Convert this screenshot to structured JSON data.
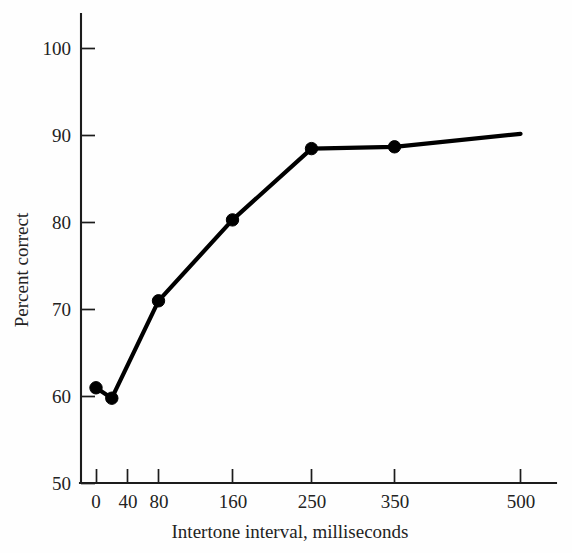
{
  "chart_data": {
    "type": "line",
    "title": "",
    "xlabel": "Intertone interval, milliseconds",
    "ylabel": "Percent correct",
    "x_tick_labels": [
      "0",
      "40",
      "80",
      "160",
      "250",
      "350",
      "500"
    ],
    "x_tick_values": [
      0,
      40,
      80,
      160,
      250,
      350,
      500
    ],
    "y_tick_labels": [
      "50",
      "60",
      "70",
      "80",
      "90",
      "100"
    ],
    "y_tick_values": [
      50,
      60,
      70,
      80,
      90,
      100
    ],
    "ylim": [
      50,
      100
    ],
    "grid": false,
    "legend": null,
    "x_axis_scale": "categorical-nonlinear",
    "series": [
      {
        "name": "Percent correct",
        "marker": "filled-circle",
        "color": "#000000",
        "points": [
          {
            "x": 0,
            "y": 61.0
          },
          {
            "x": 20,
            "y": 59.8
          },
          {
            "x": 80,
            "y": 71.0
          },
          {
            "x": 160,
            "y": 80.3
          },
          {
            "x": 250,
            "y": 88.5
          },
          {
            "x": 350,
            "y": 88.7
          },
          {
            "x": 500,
            "y": 90.2
          }
        ]
      }
    ]
  },
  "figure": {
    "background_color": "#fefefe",
    "axis_color": "#1c1c1c",
    "text_color": "#232323"
  }
}
